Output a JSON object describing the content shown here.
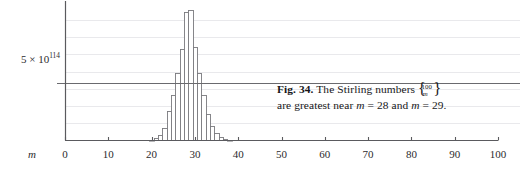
{
  "figure": {
    "caption_label": "Fig. 34.",
    "caption_line1_pre": "The Stirling numbers",
    "caption_brace_top": "100",
    "caption_brace_bottom": "m",
    "caption_line2": "are greatest near m = 28 and m = 29.",
    "caption_line2_a": "are greatest near",
    "caption_line2_m1": "m",
    "caption_line2_eq1": "= 28 and",
    "caption_line2_m2": "m",
    "caption_line2_eq2": "= 29."
  },
  "axes": {
    "x_axis_name": "m",
    "y_reference_label": "5 × 10",
    "y_reference_exponent": "114",
    "y_reference_value": 5e+114,
    "x_ticks": [
      "0",
      "10",
      "20",
      "30",
      "40",
      "50",
      "60",
      "70",
      "80",
      "90",
      "100"
    ]
  },
  "colors": {
    "axis": "#5a5a5e",
    "gridline": "#e9e9ec",
    "reference_line": "#6a6a6e",
    "bar_stroke": "#7a7a7e",
    "bar_fill": "#ffffff",
    "text": "#17171a"
  },
  "chart_data": {
    "type": "bar",
    "title": "",
    "xlabel": "m",
    "ylabel": "",
    "xlim": [
      0,
      100
    ],
    "ylim": [
      0,
      1.18e+115
    ],
    "grid": true,
    "legend": null,
    "gridline_values": [
      1.5e+114,
      3e+114,
      4.5e+114,
      6e+114,
      7.5e+114,
      9e+114,
      1.05e+115
    ],
    "reference_lines": [
      {
        "value": 5e+114,
        "label": "5 × 10^114"
      }
    ],
    "x_tick_values": [
      0,
      10,
      20,
      30,
      40,
      50,
      60,
      70,
      80,
      90,
      100
    ],
    "categories": [
      19,
      20,
      21,
      22,
      23,
      24,
      25,
      26,
      27,
      28,
      29,
      30,
      31,
      32,
      33,
      34,
      35,
      36,
      37,
      38,
      39,
      40
    ],
    "values": [
      3e+112,
      8e+112,
      2e+113,
      4.5e+113,
      1.05e+114,
      2.6e+114,
      4e+114,
      5.9e+114,
      8e+114,
      1.12e+115,
      1.14e+115,
      8.1e+114,
      5.9e+114,
      4e+114,
      2.35e+114,
      1.3e+114,
      6.2e+113,
      2.8e+113,
      1.2e+113,
      5e+112,
      2e+112,
      1e+112
    ],
    "peak_categories": [
      28,
      29
    ],
    "note": "Stirling numbers of the second kind {100 over m}; greatest near m = 28 and m = 29"
  }
}
